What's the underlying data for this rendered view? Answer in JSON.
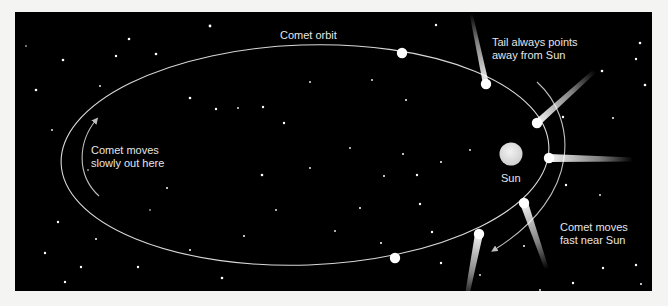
{
  "diagram": {
    "labels": {
      "orbit": "Comet orbit",
      "tail_line1": "Tail always points",
      "tail_line2": "away from Sun",
      "slow_line1": "Comet moves",
      "slow_line2": "slowly out here",
      "sun": "Sun",
      "fast_line1": "Comet moves",
      "fast_line2": "fast near Sun"
    },
    "colors": {
      "background": "#000000",
      "orbit_line": "#d8d8d8",
      "comet": "#ffffff",
      "sun": "#e8e8e8",
      "text": "#e6e6e6",
      "page": "#f4f4f2"
    },
    "comets": [
      {
        "x": 402,
        "y": 53,
        "tail": false
      },
      {
        "x": 486,
        "y": 84,
        "tail": true
      },
      {
        "x": 537,
        "y": 123,
        "tail": true
      },
      {
        "x": 549,
        "y": 158,
        "tail": true
      },
      {
        "x": 524,
        "y": 203,
        "tail": true
      },
      {
        "x": 479,
        "y": 234,
        "tail": true
      },
      {
        "x": 395,
        "y": 258,
        "tail": false
      }
    ],
    "sun": {
      "x": 511,
      "y": 154,
      "r": 11
    }
  }
}
